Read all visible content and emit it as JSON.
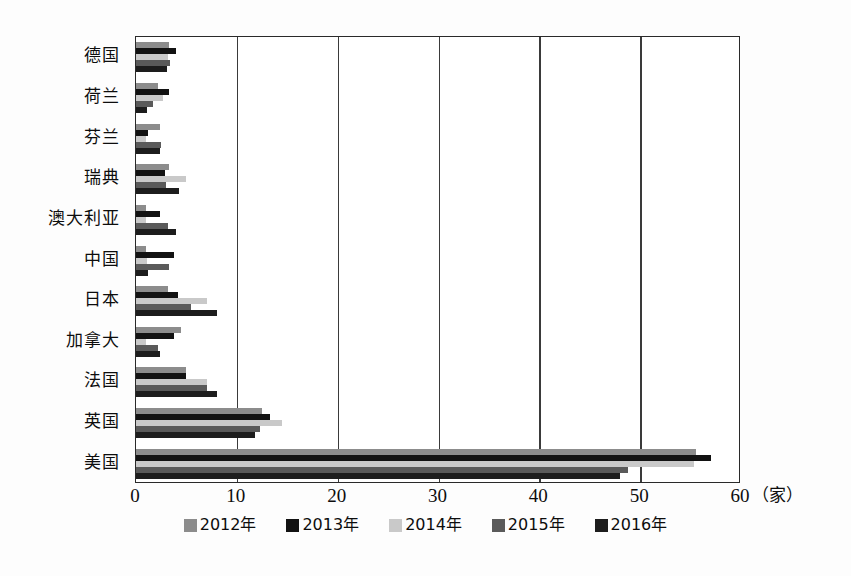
{
  "chart_data": {
    "type": "bar",
    "orientation": "horizontal",
    "title": "",
    "xlabel": "（家）",
    "ylabel": "",
    "xlim": [
      0,
      60
    ],
    "xticks": [
      0,
      10,
      20,
      30,
      40,
      50,
      60
    ],
    "xticklabels": [
      "0",
      "10",
      "20",
      "30",
      "40",
      "50",
      "60"
    ],
    "grid": true,
    "grid_axis": "x",
    "legend_position": "bottom",
    "categories": [
      "美国",
      "英国",
      "法国",
      "加拿大",
      "日本",
      "中国",
      "澳大利亚",
      "瑞典",
      "芬兰",
      "荷兰",
      "德国"
    ],
    "series": [
      {
        "name": "2012年",
        "color": "#8c8c8c",
        "values": [
          55.5,
          12.5,
          5.0,
          4.5,
          3.2,
          1.0,
          1.0,
          3.3,
          2.4,
          2.2,
          3.3
        ]
      },
      {
        "name": "2013年",
        "color": "#121212",
        "values": [
          57.0,
          13.3,
          5.0,
          3.8,
          4.2,
          3.8,
          2.4,
          2.9,
          1.2,
          3.3,
          4.0
        ]
      },
      {
        "name": "2014年",
        "color": "#c9c9c9",
        "values": [
          55.3,
          14.5,
          7.0,
          1.0,
          7.0,
          1.1,
          1.0,
          5.0,
          1.0,
          2.7,
          3.2
        ]
      },
      {
        "name": "2015年",
        "color": "#5a5a5a",
        "values": [
          48.8,
          12.3,
          7.0,
          2.2,
          5.5,
          3.3,
          3.2,
          3.0,
          2.5,
          1.7,
          3.4
        ]
      },
      {
        "name": "2016年",
        "color": "#1d1d1d",
        "values": [
          48.0,
          11.8,
          8.0,
          2.4,
          8.0,
          1.2,
          4.0,
          4.3,
          2.4,
          1.1,
          3.1
        ]
      }
    ]
  },
  "legend": {
    "items": [
      {
        "label": "2012年",
        "color": "#8c8c8c"
      },
      {
        "label": "2013年",
        "color": "#121212"
      },
      {
        "label": "2014年",
        "color": "#c9c9c9"
      },
      {
        "label": "2015年",
        "color": "#5a5a5a"
      },
      {
        "label": "2016年",
        "color": "#1d1d1d"
      }
    ]
  },
  "axis": {
    "unit_label": "（家）"
  }
}
